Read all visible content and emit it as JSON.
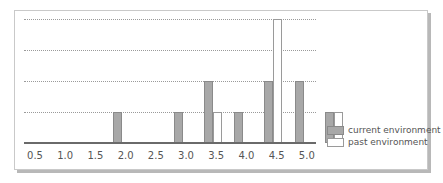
{
  "chart_data": {
    "type": "bar",
    "title": "",
    "xlabel": "",
    "ylabel": "",
    "categories": [
      "0.5",
      "1.0",
      "1.5",
      "2.0",
      "2.5",
      "3.0",
      "3.5",
      "4.0",
      "4.5",
      "5.0"
    ],
    "series": [
      {
        "name": "current environment",
        "color": "#a8a8a8",
        "values": [
          0,
          0,
          1,
          0,
          1,
          2,
          1,
          2,
          2,
          1
        ]
      },
      {
        "name": "past environment",
        "color": "#ffffff",
        "values": [
          0,
          0,
          0,
          0,
          0,
          1,
          0,
          4,
          0,
          1
        ]
      }
    ],
    "ylim": [
      0,
      4
    ],
    "grid": true,
    "legend_position": "right-bottom"
  },
  "legend": {
    "current": "current environment",
    "past": "past environment"
  },
  "ticks": [
    "0.5",
    "1.0",
    "1.5",
    "2.0",
    "2.5",
    "3.0",
    "3.5",
    "4.0",
    "4.5",
    "5.0"
  ]
}
